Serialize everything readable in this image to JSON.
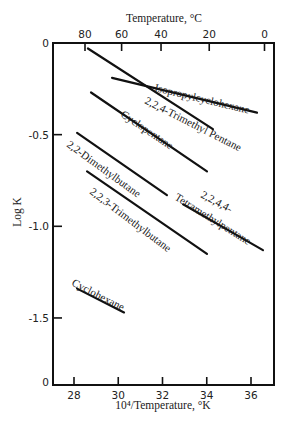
{
  "chart_data": {
    "type": "line",
    "title": "",
    "top_xlabel": "Temperature, °C",
    "xlabel": "10⁴/Temperature, °K",
    "ylabel": "Log K",
    "xlim": [
      27,
      37
    ],
    "ylim": [
      -1.87,
      0
    ],
    "x_ticks": [
      28,
      30,
      32,
      34,
      36
    ],
    "x_tick_labels": [
      "28",
      "30",
      "32",
      "34",
      "36"
    ],
    "top_x_ticks_celsius": [
      80,
      60,
      40,
      20,
      0
    ],
    "top_x_tick_labels": [
      "80",
      "60",
      "40",
      "20",
      "0"
    ],
    "y_ticks": [
      0,
      -0.5,
      -1.0,
      -1.5
    ],
    "y_tick_labels": [
      "0",
      "-0.5",
      "-1.0",
      "-1.5"
    ],
    "y_bottom_label": "0",
    "grid": false,
    "legend": "inline labels",
    "series": [
      {
        "name": "Isopropylcyclohexane",
        "x": [
          29.72,
          36.27
        ],
        "y": [
          -0.19,
          -0.38
        ]
      },
      {
        "name": "2,2,4-Trimethyl Pentane",
        "x": [
          28.63,
          34.28
        ],
        "y": [
          -0.03,
          -0.47
        ]
      },
      {
        "name": "Cyclopentane",
        "x": [
          28.77,
          34.01
        ],
        "y": [
          -0.27,
          -0.7
        ]
      },
      {
        "name": "2,2-Dimethylbutane",
        "x": [
          28.14,
          32.2
        ],
        "y": [
          -0.49,
          -0.83
        ]
      },
      {
        "name": "2,2,3-Trimethylbutane",
        "x": [
          28.59,
          34.01
        ],
        "y": [
          -0.7,
          -1.15
        ]
      },
      {
        "name": "2,2,4,4-Tetramethylpentane",
        "label_lines": [
          "2,2,4,4-",
          "Tetramethylpentane"
        ],
        "x": [
          32.93,
          36.54
        ],
        "y": [
          -0.88,
          -1.13
        ]
      },
      {
        "name": "Cyclohexane",
        "x": [
          28.14,
          30.26
        ],
        "y": [
          -1.34,
          -1.47
        ]
      }
    ]
  }
}
